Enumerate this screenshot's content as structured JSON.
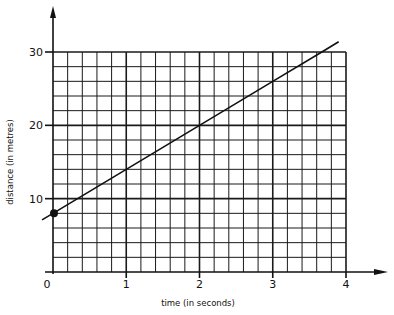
{
  "chart_data": {
    "type": "line",
    "title": "",
    "xlabel": "time (in seconds)",
    "ylabel": "distance (in metres)",
    "xlim": [
      0,
      4
    ],
    "ylim": [
      0,
      30
    ],
    "x_ticks": [
      0,
      1,
      2,
      3,
      4
    ],
    "x_tick_labels": [
      "0",
      "1",
      "2",
      "3",
      "4"
    ],
    "y_ticks": [
      10,
      20,
      30
    ],
    "y_tick_labels": [
      "10",
      "20",
      "30"
    ],
    "grid": true,
    "grid_minor_x_step": 0.2,
    "grid_minor_y_step": 2,
    "legend": null,
    "series": [
      {
        "name": "distance vs time",
        "x": [
          -0.15,
          0,
          1,
          2,
          3,
          3.67,
          3.9
        ],
        "y": [
          7.1,
          8,
          14,
          20,
          26,
          30,
          31.4
        ],
        "color": "#111111"
      }
    ],
    "marked_points": [
      {
        "x": 0,
        "y": 8,
        "label": ""
      }
    ],
    "annotations": []
  }
}
